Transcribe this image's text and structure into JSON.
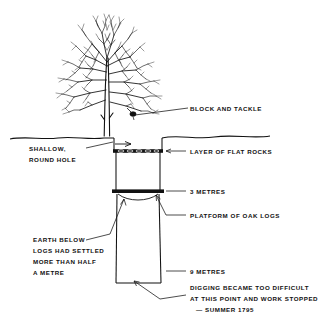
{
  "diagram": {
    "colors": {
      "ink": "#111111",
      "background": "#ffffff"
    },
    "scene": {
      "tree_label": "bare deciduous tree",
      "ground_label": "ground surface line",
      "shaft_label": "vertical shaft"
    },
    "labels": {
      "block_and_tackle": "BLOCK AND TACKLE",
      "layer_of_flat_rocks": "LAYER OF FLAT ROCKS",
      "shallow_round_hole_line1": "SHALLOW,",
      "shallow_round_hole_line2": "ROUND HOLE",
      "three_metres": "3 METRES",
      "platform_of_oak_logs": "PLATFORM OF OAK LOGS",
      "earth_below_line1": "EARTH BELOW",
      "earth_below_line2": "LOGS HAD SETTLED",
      "earth_below_line3": "MORE THAN HALF",
      "earth_below_line4": "A METRE",
      "nine_metres": "9 METRES",
      "digging_line1": "DIGGING BECAME TOO DIFFICULT",
      "digging_line2": "AT THIS POINT AND WORK STOPPED",
      "digging_line3": "— SUMMER 1795"
    },
    "depth_markers": [
      {
        "name": "flat-rocks",
        "depth": "",
        "note": "LAYER OF FLAT ROCKS"
      },
      {
        "name": "oak-platform",
        "depth": "3 METRES",
        "note": "PLATFORM OF OAK LOGS"
      },
      {
        "name": "shaft-bottom",
        "depth": "9 METRES",
        "note": "DIGGING BECAME TOO DIFFICULT"
      }
    ]
  }
}
